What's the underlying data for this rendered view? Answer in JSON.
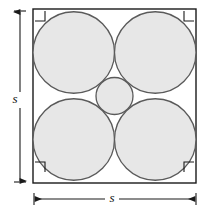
{
  "figure": {
    "background_color": "#ffffff",
    "square": {
      "name": "bounding-square",
      "side_label": "s",
      "x": 33,
      "y": 9,
      "width": 163,
      "height": 174,
      "stroke_color": "#1a1a1a",
      "stroke_width": 1.4,
      "fill": "none"
    },
    "circles": {
      "fill_color": "#e7e7e7",
      "stroke_color": "#5a5a5a",
      "stroke_width": 1.3,
      "large": [
        {
          "name": "circle-top-left",
          "cx": 73.75,
          "cy": 52.5,
          "r": 40.75
        },
        {
          "name": "circle-top-right",
          "cx": 155.25,
          "cy": 52.5,
          "r": 40.75
        },
        {
          "name": "circle-bottom-left",
          "cx": 73.75,
          "cy": 139.5,
          "r": 40.75
        },
        {
          "name": "circle-bottom-right",
          "cx": 155.25,
          "cy": 139.5,
          "r": 40.75
        }
      ],
      "small": [
        {
          "name": "circle-center",
          "cx": 114.5,
          "cy": 96.0,
          "r": 18.5
        }
      ]
    },
    "corner_marks": {
      "name": "right-angle-marker",
      "size": 10,
      "inset": 2,
      "stroke_color": "#1a1a1a",
      "stroke_width": 1.1,
      "positions": [
        {
          "name": "corner-mark-top-left",
          "x": 35,
          "y": 11
        },
        {
          "name": "corner-mark-top-right",
          "x": 184,
          "y": 11
        },
        {
          "name": "corner-mark-bottom-left",
          "x": 35,
          "y": 162
        },
        {
          "name": "corner-mark-bottom-right",
          "x": 184,
          "y": 162
        }
      ]
    },
    "dimensions": [
      {
        "name": "vertical-dimension-s",
        "orientation": "vertical",
        "label": "s",
        "label_x": 15,
        "label_y": 100,
        "line_x": 20,
        "line_y1": 11,
        "line_y2": 182,
        "cap_half_length": 6,
        "stroke_color": "#1a1a1a",
        "stroke_width": 1.1
      },
      {
        "name": "horizontal-dimension-s",
        "orientation": "horizontal",
        "label": "s",
        "label_x": 112,
        "label_y": 204,
        "line_y": 199,
        "line_x1": 34,
        "line_x2": 196,
        "cap_half_length": 6,
        "stroke_color": "#1a1a1a",
        "stroke_width": 1.1
      }
    ]
  }
}
